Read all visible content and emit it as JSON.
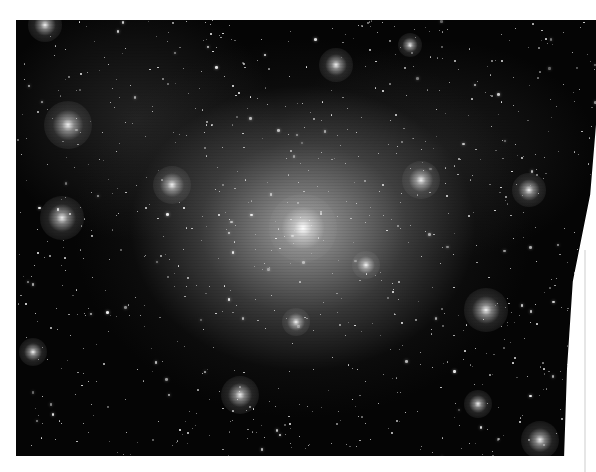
{
  "image": {
    "description": "Grayscale cosmological simulation rendering of a dark matter halo with surrounding subhalos",
    "background_color": "#ffffff",
    "field_color": "#050505",
    "central_halo": {
      "x": 303,
      "y": 228,
      "radius": 14,
      "color": "#ffffff"
    },
    "subhalos": [
      {
        "x": 68,
        "y": 125,
        "r": 10
      },
      {
        "x": 172,
        "y": 185,
        "r": 8
      },
      {
        "x": 62,
        "y": 218,
        "r": 9
      },
      {
        "x": 336,
        "y": 65,
        "r": 7
      },
      {
        "x": 421,
        "y": 180,
        "r": 8
      },
      {
        "x": 529,
        "y": 190,
        "r": 7
      },
      {
        "x": 366,
        "y": 265,
        "r": 6
      },
      {
        "x": 486,
        "y": 310,
        "r": 9
      },
      {
        "x": 296,
        "y": 322,
        "r": 6
      },
      {
        "x": 240,
        "y": 395,
        "r": 8
      },
      {
        "x": 33,
        "y": 352,
        "r": 6
      },
      {
        "x": 478,
        "y": 404,
        "r": 6
      },
      {
        "x": 410,
        "y": 45,
        "r": 5
      },
      {
        "x": 45,
        "y": 25,
        "r": 7
      },
      {
        "x": 540,
        "y": 440,
        "r": 8
      }
    ],
    "star_count": 900
  }
}
